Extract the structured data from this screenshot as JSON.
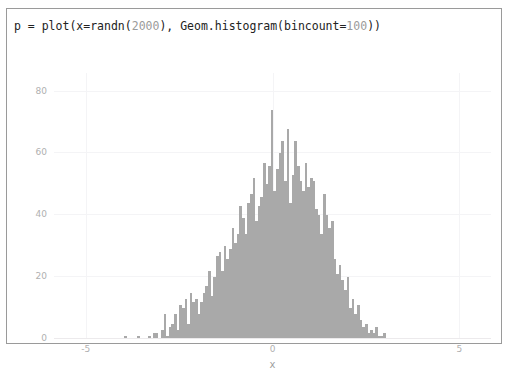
{
  "window": {
    "border_color": "#9a9a9a",
    "background": "#ffffff"
  },
  "code": {
    "prefix": "p = plot(x=randn(",
    "arg1": "2000",
    "middle": "), Geom.histogram(bincount=",
    "arg2": "100",
    "suffix": "))",
    "full_text": "p = plot(x=randn(2000), Geom.histogram(bincount=100))",
    "text_color": "#222222",
    "number_color": "#9b9b9b"
  },
  "chart_data": {
    "type": "bar",
    "title": "",
    "subtitle": "",
    "xlabel": "x",
    "ylabel": "",
    "xlim": [
      -5.85,
      5.85
    ],
    "ylim": [
      0,
      86
    ],
    "grid": true,
    "legend": "none",
    "bar_color": "#a9a9a9",
    "bincount": 100,
    "sample_size": 2000,
    "xticks": [
      {
        "value": -5,
        "label": "-5"
      },
      {
        "value": 0,
        "label": "0"
      },
      {
        "value": 5,
        "label": "5"
      }
    ],
    "yticks": [
      {
        "value": 0,
        "label": "0"
      },
      {
        "value": 20,
        "label": "20"
      },
      {
        "value": 40,
        "label": "40"
      },
      {
        "value": 60,
        "label": "60"
      },
      {
        "value": 80,
        "label": "80"
      }
    ],
    "bin_centers": [
      -3.93,
      -3.86,
      -3.79,
      -3.72,
      -3.65,
      -3.58,
      -3.51,
      -3.44,
      -3.37,
      -3.3,
      -3.23,
      -3.16,
      -3.09,
      -3.02,
      -2.95,
      -2.88,
      -2.81,
      -2.74,
      -2.67,
      -2.6,
      -2.53,
      -2.46,
      -2.39,
      -2.32,
      -2.25,
      -2.18,
      -2.11,
      -2.04,
      -1.97,
      -1.9,
      -1.83,
      -1.76,
      -1.69,
      -1.62,
      -1.55,
      -1.48,
      -1.41,
      -1.34,
      -1.27,
      -1.2,
      -1.13,
      -1.06,
      -0.99,
      -0.92,
      -0.85,
      -0.78,
      -0.71,
      -0.64,
      -0.57,
      -0.5,
      -0.43,
      -0.36,
      -0.29,
      -0.22,
      -0.15,
      -0.08,
      -0.01,
      0.06,
      0.13,
      0.2,
      0.27,
      0.34,
      0.41,
      0.48,
      0.55,
      0.62,
      0.69,
      0.76,
      0.83,
      0.9,
      0.97,
      1.04,
      1.11,
      1.18,
      1.25,
      1.32,
      1.39,
      1.46,
      1.53,
      1.6,
      1.67,
      1.74,
      1.81,
      1.88,
      1.95,
      2.02,
      2.09,
      2.16,
      2.23,
      2.3,
      2.37,
      2.44,
      2.51,
      2.58,
      2.65,
      2.72,
      2.79,
      2.86,
      2.93,
      3.0
    ],
    "values": [
      1,
      0,
      0,
      0,
      0,
      1,
      0,
      0,
      0,
      1,
      0,
      2,
      2,
      0,
      3,
      8,
      1,
      4,
      5,
      8,
      3,
      11,
      10,
      13,
      5,
      15,
      12,
      13,
      8,
      12,
      15,
      17,
      22,
      14,
      20,
      27,
      28,
      22,
      30,
      26,
      29,
      36,
      31,
      34,
      43,
      39,
      34,
      44,
      47,
      52,
      38,
      43,
      46,
      57,
      50,
      56,
      74,
      48,
      55,
      60,
      64,
      51,
      68,
      44,
      53,
      64,
      56,
      51,
      48,
      57,
      49,
      52,
      51,
      42,
      40,
      34,
      47,
      40,
      36,
      38,
      26,
      21,
      24,
      19,
      16,
      20,
      10,
      13,
      8,
      11,
      6,
      4,
      5,
      2,
      3,
      2,
      4,
      1,
      1,
      2
    ],
    "values_note": "counts per bin read off the y-axis"
  },
  "axis_label_color": "#b0b0b0",
  "xaxis_title_color": "#9f9f9f"
}
